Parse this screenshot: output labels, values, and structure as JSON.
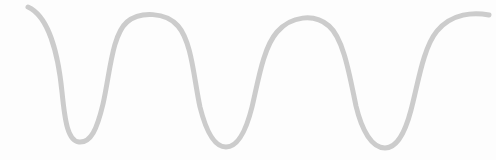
{
  "canvas": {
    "width": 496,
    "height": 160,
    "background_color": "#fdfdfd"
  },
  "wave": {
    "stroke_color": "#cccccc",
    "stroke_width": 5,
    "line_cap": "round",
    "path": "M 28 7 C 48 16, 58 52, 62 92 C 65 122, 68 141, 79 142 C 91 143, 97 129, 103 104 C 110 73, 112 35, 127 22 C 140 11, 166 12, 178 26 C 192 42, 194 80, 200 107 C 206 131, 214 147, 226 147 C 238 147, 246 131, 252 107 C 258 82, 263 48, 277 32 C 291 16, 314 13, 329 26 C 344 39, 350 78, 356 106 C 362 131, 372 148, 385 148 C 397 148, 405 133, 411 110 C 418 84, 423 48, 437 31 C 452 13, 474 12, 489 15"
  },
  "description": {
    "type": "wave-illustration",
    "peaks": 3,
    "troughs": 3,
    "trough_points": [
      {
        "x": 79,
        "y": 142
      },
      {
        "x": 226,
        "y": 147
      },
      {
        "x": 385,
        "y": 148
      }
    ],
    "peak_points": [
      {
        "x": 152,
        "y": 17
      },
      {
        "x": 315,
        "y": 20
      }
    ],
    "start_point": {
      "x": 28,
      "y": 7
    },
    "end_point": {
      "x": 489,
      "y": 15
    }
  }
}
